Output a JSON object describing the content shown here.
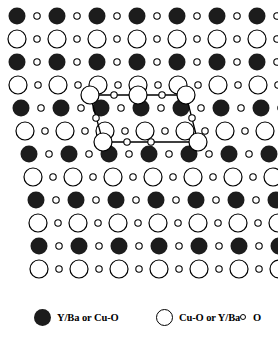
{
  "figure": {
    "name": "crystal-lattice-projection",
    "background_color": "#ffffff",
    "line_color": "#000000",
    "filled_color": "#1c1c1c"
  },
  "lattice": {
    "columns": 7,
    "rows": 12,
    "x_spacing": 40,
    "y_spacing": 23,
    "origin_x": 17,
    "origin_y": 16,
    "shear_per_row": 3,
    "large_filled_radius": 8.5,
    "large_open_radius": 9,
    "small_open_radius": 3.2,
    "row_types": [
      "filled-major",
      "open-major",
      "filled-major",
      "open-major",
      "filled-major",
      "open-major",
      "filled-major",
      "open-major",
      "filled-major",
      "open-major",
      "filled-major",
      "open-major"
    ],
    "row_offsets": [
      0,
      0,
      0,
      1,
      4,
      8,
      12,
      16,
      19,
      21,
      22,
      22
    ]
  },
  "unit_cell": {
    "name": "unit-cell-parallelogram",
    "stroke_width": 1.3,
    "vertices": [
      {
        "x": 90,
        "y": 95
      },
      {
        "x": 186,
        "y": 95
      },
      {
        "x": 198,
        "y": 142
      },
      {
        "x": 103,
        "y": 142
      }
    ],
    "top_edge_nodes": [
      {
        "x": 90,
        "y": 95,
        "type": "large-open"
      },
      {
        "x": 114,
        "y": 95,
        "type": "small-open"
      },
      {
        "x": 138,
        "y": 95,
        "type": "large-open"
      },
      {
        "x": 162,
        "y": 95,
        "type": "small-open"
      },
      {
        "x": 186,
        "y": 95,
        "type": "large-open"
      }
    ],
    "bottom_edge_nodes": [
      {
        "x": 103,
        "y": 142,
        "type": "large-open"
      },
      {
        "x": 127,
        "y": 142,
        "type": "small-open"
      },
      {
        "x": 151,
        "y": 142,
        "type": "small-open"
      },
      {
        "x": 198,
        "y": 142,
        "type": "large-open"
      }
    ],
    "left_edge_nodes": [
      {
        "x": 96,
        "y": 118,
        "type": "small-open"
      }
    ],
    "right_edge_nodes": [
      {
        "x": 192,
        "y": 118,
        "type": "small-open"
      }
    ]
  },
  "legend": {
    "items": [
      {
        "symbol": "filled-large-circle",
        "label": "Y/Ba or Cu-O"
      },
      {
        "symbol": "open-large-circle",
        "label": "Cu-O or Y/Ba"
      },
      {
        "symbol": "open-small-circle",
        "label": "O"
      }
    ]
  },
  "chart_data": {
    "type": "scatter",
    "title": "",
    "xlabel": "",
    "ylabel": "",
    "legend_position": "bottom",
    "grid": false,
    "series": [
      {
        "name": "Y/Ba or Cu-O",
        "marker": "filled-large-circle",
        "count": 42
      },
      {
        "name": "Cu-O or Y/Ba",
        "marker": "open-large-circle",
        "count": 36
      },
      {
        "name": "O",
        "marker": "open-small-circle",
        "count": 78
      }
    ]
  }
}
